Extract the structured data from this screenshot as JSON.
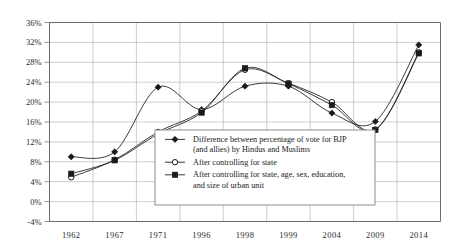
{
  "chart_data": {
    "type": "line",
    "title": "",
    "subtitle": "",
    "xlabel": "",
    "ylabel": "",
    "categories": [
      "1962",
      "1967",
      "1971",
      "1996",
      "1998",
      "1999",
      "2004",
      "2009",
      "2014"
    ],
    "ylim": [
      -4,
      36
    ],
    "ytick_labels": [
      "36%",
      "32%",
      "28%",
      "24%",
      "20%",
      "16%",
      "12%",
      "8%",
      "4%",
      "0%",
      "-4%"
    ],
    "ytick_values": [
      36,
      32,
      28,
      24,
      20,
      16,
      12,
      8,
      4,
      0,
      -4
    ],
    "grid": "horizontal-and-vertical",
    "legend_position": "center",
    "smoothing": "spline",
    "series": [
      {
        "name": "Difference between percentage of vote for BJP (and allies) by Hindus and Muslims",
        "marker": "diamond",
        "values": [
          9.0,
          10.0,
          23.0,
          18.5,
          23.2,
          23.2,
          17.8,
          16.1,
          31.5
        ]
      },
      {
        "name": "After controlling for state",
        "marker": "open-circle",
        "values": [
          4.9,
          8.4,
          14.0,
          18.2,
          26.5,
          23.8,
          20.0,
          14.5,
          30.0
        ]
      },
      {
        "name": "After controlling for state, age, sex, education, and size of urban unit",
        "marker": "square",
        "values": [
          5.6,
          8.3,
          13.6,
          17.9,
          26.8,
          23.7,
          19.4,
          14.4,
          29.8
        ]
      }
    ],
    "legend": [
      {
        "marker": "diamond",
        "lines": [
          "Difference between percentage of vote for BJP",
          "(and allies) by Hindus and Muslims"
        ]
      },
      {
        "marker": "open-circle",
        "lines": [
          "After controlling for state"
        ]
      },
      {
        "marker": "square",
        "lines": [
          "After controlling for state, age, sex, education,",
          "and size of urban unit"
        ]
      }
    ],
    "colors": {
      "line": "#262626",
      "grid": "#b9b9b9",
      "frame": "#8a8a8a",
      "text": "#1a1a1a",
      "background": "#ffffff"
    }
  }
}
